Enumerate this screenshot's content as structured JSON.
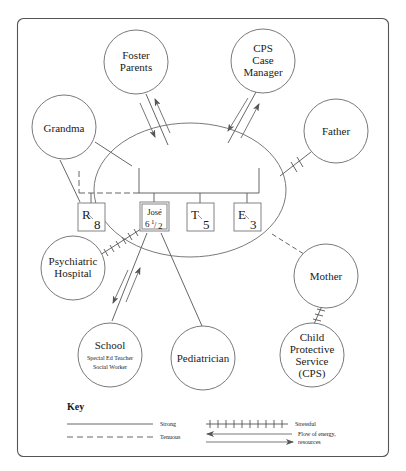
{
  "diagram": {
    "type": "ecomap",
    "family_children": [
      {
        "initial": "R",
        "age": "8"
      },
      {
        "initial": "José",
        "age": "6½",
        "age_whole": "6",
        "age_frac_num": "1",
        "age_frac_den": "2",
        "is_focus": true
      },
      {
        "initial": "T",
        "age": "5"
      },
      {
        "initial": "E",
        "age": "3"
      }
    ],
    "nodes": {
      "foster_parents": [
        "Foster",
        "Parents"
      ],
      "cps_case_manager": [
        "CPS",
        "Case",
        "Manager"
      ],
      "grandma": [
        "Grandma"
      ],
      "father": [
        "Father"
      ],
      "psychiatric_hospital": [
        "Psychiatric",
        "Hospital"
      ],
      "mother": [
        "Mother"
      ],
      "school": {
        "title": "School",
        "sub": [
          "Special Ed Teacher",
          "Social Worker"
        ]
      },
      "pediatrician": [
        "Pediatrician"
      ],
      "cps": [
        "Child",
        "Protective",
        "Service",
        "(CPS)"
      ]
    },
    "connections": [
      {
        "from": "Foster Parents",
        "to": "Family",
        "type": "strong",
        "flow": "both"
      },
      {
        "from": "CPS Case Manager",
        "to": "Family",
        "type": "strong",
        "flow": "both"
      },
      {
        "from": "Grandma",
        "to": "Family",
        "type": "strong"
      },
      {
        "from": "Grandma",
        "to": "R",
        "type": "strong"
      },
      {
        "from": "Father",
        "to": "Family",
        "type": "stressful"
      },
      {
        "from": "Mother",
        "to": "Family",
        "type": "tenuous"
      },
      {
        "from": "Mother",
        "to": "Child Protective Service (CPS)",
        "type": "stressful"
      },
      {
        "from": "Psychiatric Hospital",
        "to": "José",
        "type": "stressful"
      },
      {
        "from": "School",
        "to": "José",
        "type": "strong",
        "flow": "both"
      },
      {
        "from": "Pediatrician",
        "to": "José",
        "type": "strong"
      }
    ],
    "key": {
      "title": "Key",
      "strong": "Strong",
      "tenuous": "Tenuous",
      "stressful": "Stressful",
      "flow_line1": "Flow of energy,",
      "flow_line2": "resources"
    }
  }
}
